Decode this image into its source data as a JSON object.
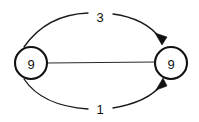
{
  "diagram": {
    "type": "directed-multigraph",
    "background_color": "#ffffff",
    "stroke_color": "#111111",
    "nodes": [
      {
        "id": "left",
        "label": "9",
        "cx": 31,
        "cy": 63,
        "r": 16
      },
      {
        "id": "right",
        "label": "9",
        "cx": 171,
        "cy": 63,
        "r": 16
      }
    ],
    "edges": [
      {
        "id": "edge-top",
        "label": "3",
        "from": "left",
        "to": "right",
        "shape": "arc-above",
        "directed": true,
        "arrow_at": "right",
        "label_x": 100,
        "label_y": 16
      },
      {
        "id": "edge-middle",
        "label": "",
        "from": "left",
        "to": "right",
        "shape": "straight",
        "directed": false,
        "arrow_at": "none",
        "label_x": 100,
        "label_y": 63
      },
      {
        "id": "edge-bottom",
        "label": "1",
        "from": "left",
        "to": "right",
        "shape": "arc-below",
        "directed": true,
        "arrow_at": "right",
        "label_x": 100,
        "label_y": 108
      }
    ]
  }
}
